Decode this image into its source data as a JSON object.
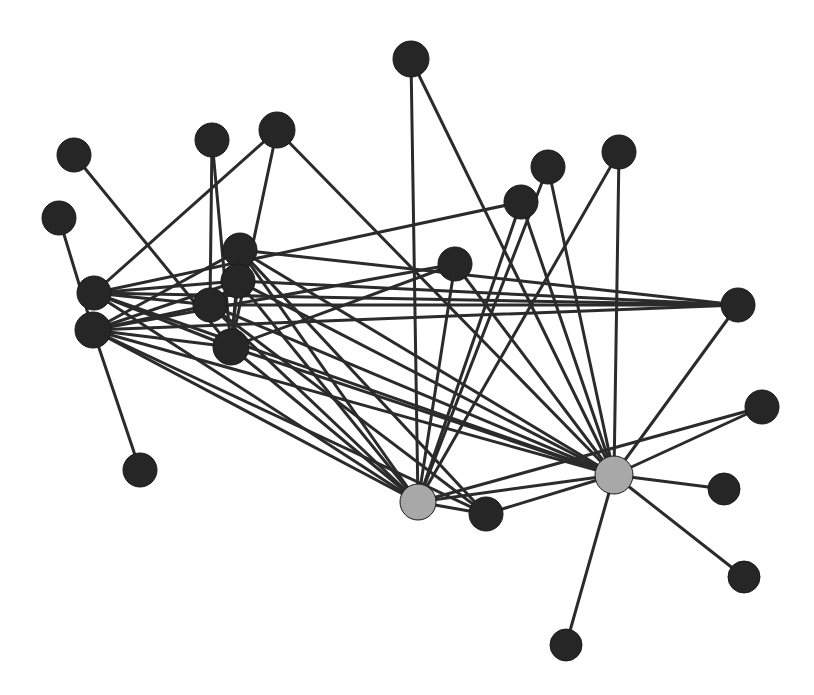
{
  "figure": {
    "kind": "network-graph",
    "title": "",
    "background_color": "#ffffff",
    "width": 814,
    "height": 695
  },
  "chart_data": {
    "type": "scatter",
    "title": "",
    "xlabel": "",
    "ylabel": "",
    "grid": false,
    "legend_position": "none",
    "layout": "force-directed node-link diagram",
    "node_count": 26,
    "edge_count": 60,
    "node_styles": {
      "default": {
        "fill": "#262626",
        "stroke": "#1a1a1a",
        "radius": 17
      },
      "hub": {
        "fill": "#a8a8a8",
        "stroke": "#1a1a1a",
        "radius": 18
      }
    },
    "edge_style": {
      "color": "#2b2b2b",
      "width": 3
    },
    "nodes": [
      {
        "id": "n0",
        "x": 74,
        "y": 155,
        "r": 17,
        "group": "default"
      },
      {
        "id": "n1",
        "x": 59,
        "y": 218,
        "r": 17,
        "group": "default"
      },
      {
        "id": "n2",
        "x": 94,
        "y": 293,
        "r": 17,
        "group": "default"
      },
      {
        "id": "n3",
        "x": 93,
        "y": 330,
        "r": 18,
        "group": "default"
      },
      {
        "id": "n4",
        "x": 140,
        "y": 470,
        "r": 17,
        "group": "default"
      },
      {
        "id": "n5",
        "x": 212,
        "y": 140,
        "r": 17,
        "group": "default"
      },
      {
        "id": "n6",
        "x": 277,
        "y": 130,
        "r": 18,
        "group": "default"
      },
      {
        "id": "n7",
        "x": 240,
        "y": 250,
        "r": 17,
        "group": "default"
      },
      {
        "id": "n8",
        "x": 238,
        "y": 281,
        "r": 17,
        "group": "default"
      },
      {
        "id": "n9",
        "x": 210,
        "y": 305,
        "r": 17,
        "group": "default"
      },
      {
        "id": "n10",
        "x": 231,
        "y": 347,
        "r": 18,
        "group": "default"
      },
      {
        "id": "n11",
        "x": 411,
        "y": 59,
        "r": 18,
        "group": "default"
      },
      {
        "id": "n12",
        "x": 455,
        "y": 264,
        "r": 17,
        "group": "default"
      },
      {
        "id": "n13",
        "x": 521,
        "y": 202,
        "r": 17,
        "group": "default"
      },
      {
        "id": "n14",
        "x": 548,
        "y": 167,
        "r": 17,
        "group": "default"
      },
      {
        "id": "n15",
        "x": 619,
        "y": 152,
        "r": 17,
        "group": "default"
      },
      {
        "id": "n16",
        "x": 738,
        "y": 305,
        "r": 17,
        "group": "default"
      },
      {
        "id": "n17",
        "x": 762,
        "y": 407,
        "r": 17,
        "group": "default"
      },
      {
        "id": "n18",
        "x": 724,
        "y": 489,
        "r": 16,
        "group": "default"
      },
      {
        "id": "n19",
        "x": 744,
        "y": 577,
        "r": 16,
        "group": "default"
      },
      {
        "id": "n20",
        "x": 566,
        "y": 645,
        "r": 16,
        "group": "default"
      },
      {
        "id": "n21",
        "x": 486,
        "y": 514,
        "r": 17,
        "group": "default"
      },
      {
        "id": "n22",
        "x": 418,
        "y": 502,
        "r": 18,
        "group": "hub"
      },
      {
        "id": "n23",
        "x": 614,
        "y": 475,
        "r": 19,
        "group": "hub"
      },
      {
        "id": "n24",
        "x": 252,
        "y": 316,
        "r": 0,
        "group": "default"
      },
      {
        "id": "n25",
        "x": 104,
        "y": 312,
        "r": 0,
        "group": "default"
      }
    ],
    "edges": [
      {
        "source": "n0",
        "target": "n10"
      },
      {
        "source": "n1",
        "target": "n3"
      },
      {
        "source": "n2",
        "target": "n6"
      },
      {
        "source": "n2",
        "target": "n13"
      },
      {
        "source": "n2",
        "target": "n16"
      },
      {
        "source": "n2",
        "target": "n22"
      },
      {
        "source": "n2",
        "target": "n23"
      },
      {
        "source": "n2",
        "target": "n8"
      },
      {
        "source": "n3",
        "target": "n4"
      },
      {
        "source": "n3",
        "target": "n7"
      },
      {
        "source": "n3",
        "target": "n8"
      },
      {
        "source": "n3",
        "target": "n9"
      },
      {
        "source": "n3",
        "target": "n10"
      },
      {
        "source": "n3",
        "target": "n12"
      },
      {
        "source": "n3",
        "target": "n16"
      },
      {
        "source": "n3",
        "target": "n22"
      },
      {
        "source": "n3",
        "target": "n23"
      },
      {
        "source": "n3",
        "target": "n21"
      },
      {
        "source": "n5",
        "target": "n9"
      },
      {
        "source": "n6",
        "target": "n23"
      },
      {
        "source": "n7",
        "target": "n22"
      },
      {
        "source": "n7",
        "target": "n23"
      },
      {
        "source": "n7",
        "target": "n16"
      },
      {
        "source": "n7",
        "target": "n10"
      },
      {
        "source": "n8",
        "target": "n22"
      },
      {
        "source": "n8",
        "target": "n23"
      },
      {
        "source": "n8",
        "target": "n9"
      },
      {
        "source": "n8",
        "target": "n10"
      },
      {
        "source": "n9",
        "target": "n22"
      },
      {
        "source": "n9",
        "target": "n23"
      },
      {
        "source": "n9",
        "target": "n16"
      },
      {
        "source": "n10",
        "target": "n22"
      },
      {
        "source": "n10",
        "target": "n23"
      },
      {
        "source": "n10",
        "target": "n12"
      },
      {
        "source": "n11",
        "target": "n22"
      },
      {
        "source": "n11",
        "target": "n23"
      },
      {
        "source": "n12",
        "target": "n22"
      },
      {
        "source": "n13",
        "target": "n22"
      },
      {
        "source": "n13",
        "target": "n23"
      },
      {
        "source": "n14",
        "target": "n22"
      },
      {
        "source": "n15",
        "target": "n22"
      },
      {
        "source": "n16",
        "target": "n23"
      },
      {
        "source": "n17",
        "target": "n22"
      },
      {
        "source": "n17",
        "target": "n23"
      },
      {
        "source": "n18",
        "target": "n23"
      },
      {
        "source": "n19",
        "target": "n23"
      },
      {
        "source": "n20",
        "target": "n23"
      },
      {
        "source": "n21",
        "target": "n22"
      },
      {
        "source": "n21",
        "target": "n23"
      },
      {
        "source": "n22",
        "target": "n23"
      },
      {
        "source": "n6",
        "target": "n10"
      },
      {
        "source": "n5",
        "target": "n10"
      },
      {
        "source": "n9",
        "target": "n21"
      },
      {
        "source": "n8",
        "target": "n16"
      },
      {
        "source": "n7",
        "target": "n21"
      },
      {
        "source": "n12",
        "target": "n23"
      },
      {
        "source": "n14",
        "target": "n23"
      },
      {
        "source": "n15",
        "target": "n23"
      },
      {
        "source": "n2",
        "target": "n10"
      },
      {
        "source": "n2",
        "target": "n9"
      }
    ]
  }
}
